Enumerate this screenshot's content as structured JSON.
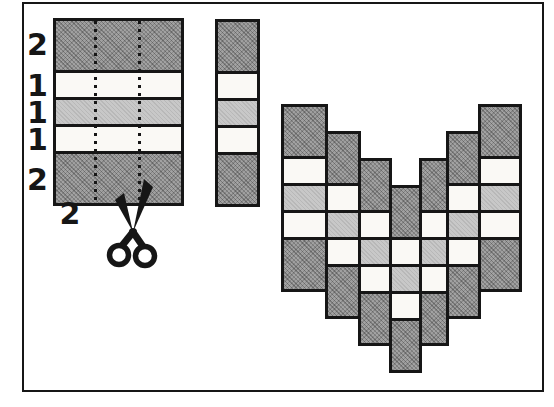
{
  "panel": {
    "rows": [
      {
        "shade": "dark",
        "units": 2,
        "label": "2"
      },
      {
        "shade": "white",
        "units": 1,
        "label": "1"
      },
      {
        "shade": "light",
        "units": 1,
        "label": "1"
      },
      {
        "shade": "white",
        "units": 1,
        "label": "1"
      },
      {
        "shade": "dark",
        "units": 2,
        "label": "2"
      }
    ],
    "width_label": "2",
    "cut_line_count": 2
  },
  "strip": {
    "rows": [
      {
        "shade": "dark",
        "units": 2
      },
      {
        "shade": "white",
        "units": 1
      },
      {
        "shade": "light",
        "units": 1
      },
      {
        "shade": "white",
        "units": 1
      },
      {
        "shade": "dark",
        "units": 2
      }
    ]
  },
  "chevron": {
    "rows": [
      {
        "shade": "dark",
        "units": 2
      },
      {
        "shade": "white",
        "units": 1
      },
      {
        "shade": "light",
        "units": 1
      },
      {
        "shade": "white",
        "units": 1
      },
      {
        "shade": "dark",
        "units": 2
      }
    ],
    "column_shifts": [
      0,
      1,
      2,
      3,
      2,
      1,
      0
    ]
  },
  "icons": {
    "scissors": "scissors-icon"
  },
  "colors": {
    "dark_fabric": "#9e9e9e",
    "light_fabric": "#c8c8c8",
    "white_fabric": "#faf9f5",
    "line": "#161616",
    "background": "#ffffff"
  }
}
